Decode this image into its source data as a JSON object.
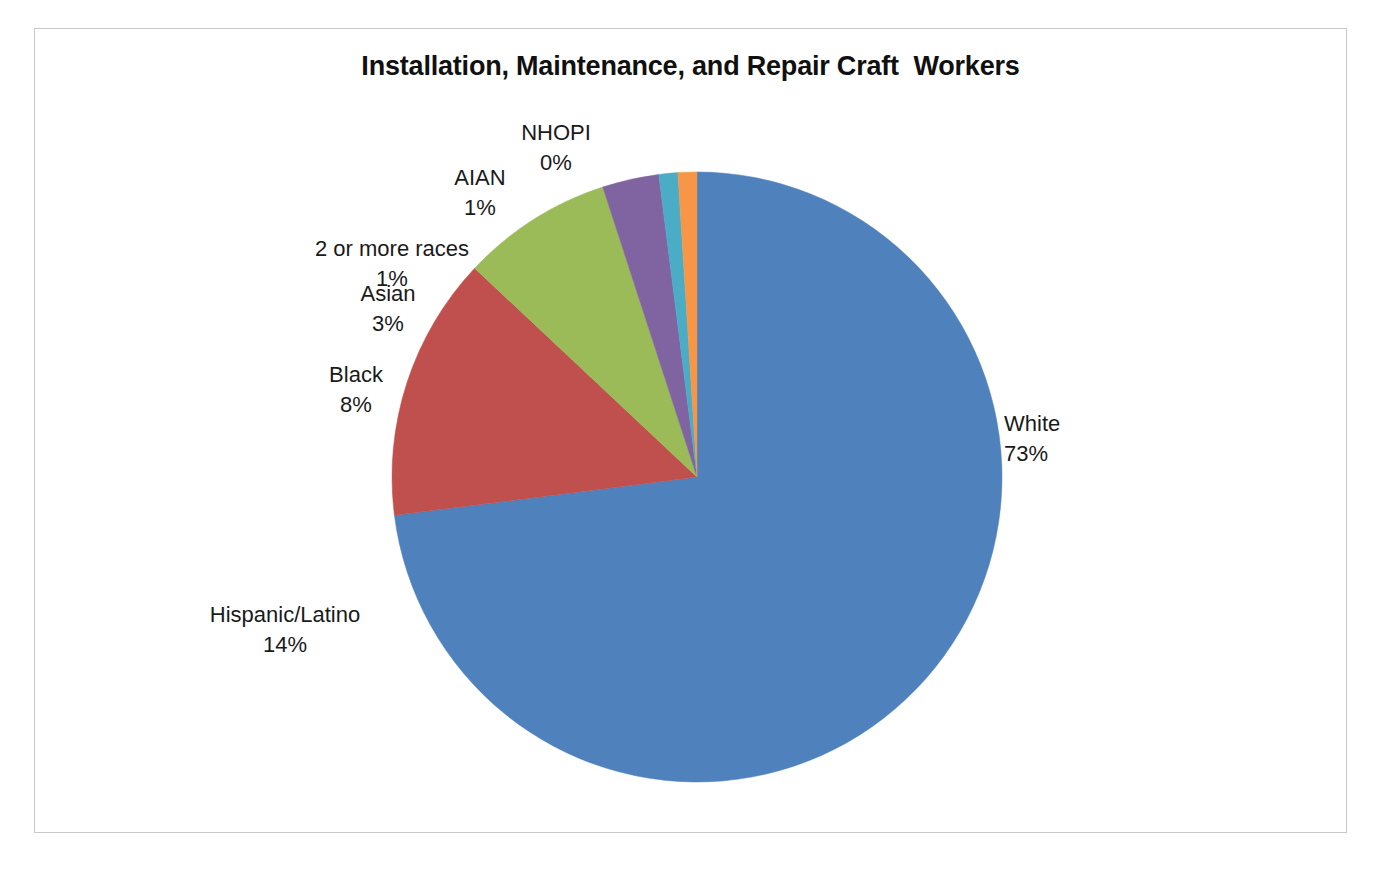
{
  "chart_data": {
    "type": "pie",
    "title": "Installation, Maintenance, and Repair Craft  Workers",
    "xlabel": "",
    "ylabel": "",
    "legend": "none",
    "grid": false,
    "data_labels": "category name and percentage, outside end",
    "start_angle_deg": 0,
    "direction": "clockwise",
    "categories": [
      "White",
      "Hispanic/Latino",
      "Black",
      "Asian",
      "2 or more races",
      "AIAN",
      "NHOPI"
    ],
    "values": [
      73,
      14,
      8,
      3,
      1,
      1,
      0
    ],
    "value_labels": [
      "73%",
      "14%",
      "8%",
      "3%",
      "1%",
      "1%",
      "0%"
    ],
    "colors": [
      "#4f81bd",
      "#c0504d",
      "#9bbb59",
      "#8064a2",
      "#4bacc6",
      "#f79646",
      "#f79646"
    ],
    "slices": [
      {
        "name": "White",
        "value": 73,
        "label": "73%",
        "color": "#4f81bd"
      },
      {
        "name": "Hispanic/Latino",
        "value": 14,
        "label": "14%",
        "color": "#c0504d"
      },
      {
        "name": "Black",
        "value": 8,
        "label": "8%",
        "color": "#9bbb59"
      },
      {
        "name": "Asian",
        "value": 3,
        "label": "3%",
        "color": "#8064a2"
      },
      {
        "name": "2 or more races",
        "value": 1,
        "label": "1%",
        "color": "#4bacc6"
      },
      {
        "name": "AIAN",
        "value": 1,
        "label": "1%",
        "color": "#f79646"
      },
      {
        "name": "NHOPI",
        "value": 0,
        "label": "0%",
        "color": "#f79646"
      }
    ]
  },
  "frame": {
    "border_color": "#c9c9c9",
    "background": "#ffffff"
  }
}
